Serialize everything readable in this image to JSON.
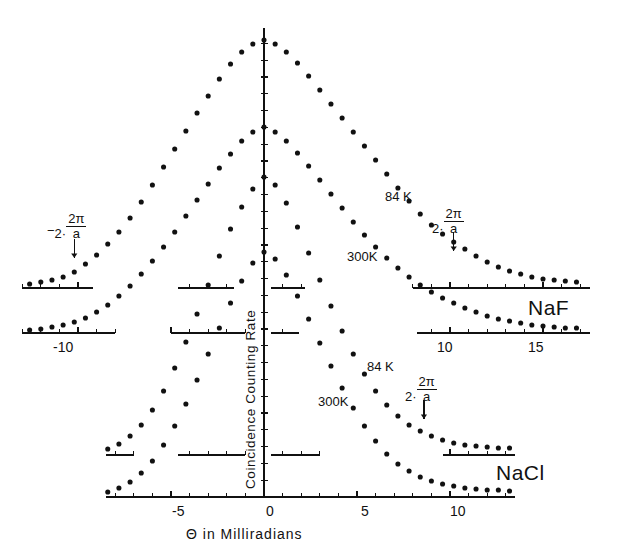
{
  "figure": {
    "xaxis_title": "Θ  in  Milliradians",
    "yaxis_title": "Coincidence  Counting  Rate",
    "x_tick_labels_nacl": [
      "-5",
      "0",
      "5",
      "10"
    ],
    "x_tick_labels_naf": [
      "-10",
      "10",
      "15"
    ],
    "materials": {
      "upper": "NaF",
      "lower": "NaCl"
    },
    "series_labels": {
      "naf_cold": "84 K",
      "naf_warm": "300K",
      "nacl_cold": "84 K",
      "nacl_warm": "300K"
    },
    "annotations": {
      "left_umklapp": {
        "sign": "−",
        "num": "2·",
        "top": "2π",
        "bot": "a"
      },
      "right_naf": {
        "sign": "",
        "num": "2·",
        "top": "2π",
        "bot": "a"
      },
      "right_nacl": {
        "sign": "",
        "num": "2·",
        "top": "2π",
        "bot": "a"
      }
    },
    "ink_color": "#111111",
    "background_color": "#ffffff"
  },
  "chart_data": {
    "type": "scatter",
    "title": "",
    "xlabel": "Θ in Milliradians",
    "ylabel": "Coincidence Counting Rate",
    "xlim": [
      -13.0,
      17.5
    ],
    "grid": false,
    "legend": "inline-annotations",
    "axes": [
      {
        "name": "naf-84k-baseline",
        "y_baseline_px": 288,
        "tick_labels": [],
        "x_range": [
          -13.0,
          17.5
        ]
      },
      {
        "name": "naf-300k-baseline",
        "y_baseline_px": 333,
        "tick_labels": [
          "-10",
          "10",
          "15"
        ],
        "x_range": [
          -13.0,
          17.5
        ]
      },
      {
        "name": "nacl-84k-baseline",
        "y_baseline_px": 455,
        "tick_labels": [],
        "x_range": [
          -8.5,
          13.5
        ]
      },
      {
        "name": "nacl-300k-baseline",
        "y_baseline_px": 497,
        "tick_labels": [
          "-5",
          "0",
          "5",
          "10"
        ],
        "x_range": [
          -8.5,
          13.5
        ]
      }
    ],
    "umklapp_positions": {
      "left": -10.2,
      "right_naf": 10.2,
      "right_nacl": 8.6
    },
    "series": [
      {
        "name": "NaF 84 K",
        "label": "84 K",
        "baseline": 288,
        "x": [
          -12.6,
          -12.0,
          -11.4,
          -10.8,
          -10.2,
          -9.6,
          -9.0,
          -8.4,
          -7.8,
          -7.2,
          -6.6,
          -6.0,
          -5.4,
          -4.8,
          -4.2,
          -3.6,
          -3.0,
          -2.4,
          -1.8,
          -1.2,
          -0.6,
          0,
          0.6,
          1.2,
          1.8,
          2.4,
          3.0,
          3.6,
          4.2,
          4.8,
          5.4,
          6.0,
          6.6,
          7.2,
          7.8,
          8.4,
          9.0,
          9.6,
          10.2,
          10.8,
          11.4,
          12.0,
          12.6,
          13.2,
          13.8,
          14.4,
          15.0,
          15.6,
          16.2,
          16.8
        ],
        "y": [
          4,
          6,
          8,
          11,
          16,
          24,
          33,
          44,
          56,
          70,
          86,
          103,
          121,
          139,
          157,
          175,
          192,
          209,
          224,
          236,
          244,
          248,
          244,
          236,
          225,
          212,
          198,
          184,
          170,
          156,
          142,
          128,
          114,
          100,
          87,
          74,
          63,
          54,
          46,
          39,
          32,
          26,
          21,
          17,
          14,
          11,
          9,
          8,
          7,
          6
        ]
      },
      {
        "name": "NaF 300 K",
        "label": "300K",
        "baseline": 333,
        "x": [
          -12.6,
          -12.0,
          -11.4,
          -10.8,
          -10.2,
          -9.6,
          -9.0,
          -8.4,
          -7.8,
          -7.2,
          -6.6,
          -6.0,
          -5.4,
          -4.8,
          -4.2,
          -3.6,
          -3.0,
          -2.4,
          -1.8,
          -1.2,
          -0.6,
          0,
          0.6,
          1.2,
          1.8,
          2.4,
          3.0,
          3.6,
          4.2,
          4.8,
          5.4,
          6.0,
          6.6,
          7.2,
          7.8,
          8.4,
          9.0,
          9.6,
          10.2,
          10.8,
          11.4,
          12.0,
          12.6,
          13.2,
          13.8,
          14.4,
          15.0,
          15.6,
          16.2,
          16.8
        ],
        "y": [
          3,
          4,
          6,
          8,
          11,
          15,
          21,
          28,
          37,
          47,
          59,
          72,
          86,
          101,
          117,
          133,
          149,
          165,
          179,
          192,
          201,
          206,
          201,
          192,
          180,
          167,
          153,
          139,
          125,
          111,
          98,
          86,
          75,
          65,
          56,
          48,
          41,
          35,
          30,
          25,
          21,
          17,
          14,
          12,
          10,
          8,
          7,
          6,
          5,
          5
        ]
      },
      {
        "name": "NaCl 84 K",
        "label": "84 K",
        "baseline": 455,
        "x": [
          -8.4,
          -7.8,
          -7.2,
          -6.6,
          -6.0,
          -5.4,
          -4.8,
          -4.2,
          -3.6,
          -3.0,
          -2.4,
          -1.8,
          -1.2,
          -0.6,
          0,
          0.6,
          1.2,
          1.8,
          2.4,
          3.0,
          3.6,
          4.2,
          4.8,
          5.4,
          6.0,
          6.6,
          7.2,
          7.8,
          8.4,
          9.0,
          9.6,
          10.2,
          10.8,
          11.4,
          12.0,
          12.6,
          13.2
        ],
        "y": [
          6,
          11,
          19,
          30,
          45,
          64,
          87,
          113,
          141,
          170,
          199,
          226,
          248,
          266,
          278,
          270,
          252,
          228,
          202,
          175,
          149,
          124,
          101,
          81,
          64,
          50,
          39,
          30,
          24,
          19,
          15,
          12,
          10,
          9,
          8,
          7,
          7
        ]
      },
      {
        "name": "NaCl 300 K",
        "label": "300K",
        "baseline": 497,
        "x": [
          -8.4,
          -7.8,
          -7.2,
          -6.6,
          -6.0,
          -5.4,
          -4.8,
          -4.2,
          -3.6,
          -3.0,
          -2.4,
          -1.8,
          -1.2,
          -0.6,
          0,
          0.6,
          1.2,
          1.8,
          2.4,
          3.0,
          3.6,
          4.2,
          4.8,
          5.4,
          6.0,
          6.6,
          7.2,
          7.8,
          8.4,
          9.0,
          9.6,
          10.2,
          10.8,
          11.4,
          12.0,
          12.6,
          13.2
        ],
        "y": [
          5,
          9,
          15,
          24,
          36,
          52,
          71,
          93,
          117,
          143,
          169,
          194,
          216,
          234,
          245,
          238,
          222,
          201,
          178,
          154,
          131,
          109,
          89,
          71,
          56,
          43,
          33,
          26,
          20,
          16,
          13,
          11,
          9,
          8,
          7,
          7,
          6
        ]
      }
    ]
  }
}
